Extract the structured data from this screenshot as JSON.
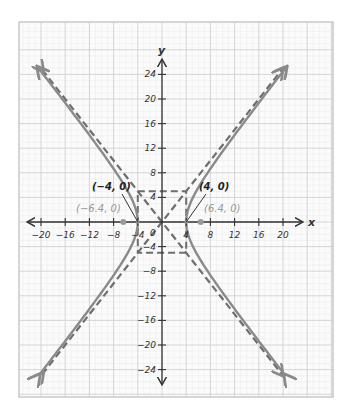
{
  "chart_data": {
    "type": "line",
    "title": "",
    "xlabel": "x",
    "ylabel": "y",
    "xlim": [
      -24,
      28
    ],
    "ylim": [
      -28,
      32
    ],
    "grid": true,
    "x_ticks": [
      -20,
      -16,
      -12,
      -8,
      -4,
      4,
      8,
      12,
      16,
      20
    ],
    "x_tick_labels": [
      "−20",
      "−16",
      "−12",
      "−8",
      "−4",
      "4",
      "8",
      "12",
      "16",
      "20"
    ],
    "y_ticks": [
      24,
      20,
      16,
      12,
      8,
      4,
      -4,
      -8,
      -12,
      -16,
      -20,
      -24
    ],
    "y_tick_labels": [
      "24",
      "20",
      "16",
      "12",
      "8",
      "4",
      "−4",
      "−8",
      "−12",
      "−16",
      "−20",
      "−24"
    ],
    "origin_label": "0",
    "series": [
      {
        "name": "hyperbola",
        "equation": "x^2/16 - y^2/25 = 1",
        "style": "solid",
        "a": 4,
        "b": 5
      },
      {
        "name": "asymptote positive",
        "equation": "y = 1.25x",
        "style": "dashed"
      },
      {
        "name": "asymptote negative",
        "equation": "y = -1.25x",
        "style": "dashed"
      },
      {
        "name": "central rectangle",
        "corners": [
          [
            -4,
            5
          ],
          [
            4,
            5
          ],
          [
            4,
            -5
          ],
          [
            -4,
            -5
          ]
        ],
        "style": "dashed"
      }
    ],
    "annotations": [
      {
        "label": "(−4, 0)",
        "x": -4,
        "y": 0,
        "kind": "vertex"
      },
      {
        "label": "(4, 0)",
        "x": 4,
        "y": 0,
        "kind": "vertex"
      },
      {
        "label": "(−6.4, 0)",
        "x": -6.4,
        "y": 0,
        "kind": "focus"
      },
      {
        "label": "(6.4, 0)",
        "x": 6.4,
        "y": 0,
        "kind": "focus"
      }
    ],
    "colors": {
      "curve": "#8a8a8a",
      "asymptote": "#6e6e6e",
      "axis": "#333333",
      "grid_major": "#cfcfcf",
      "grid_minor": "#e8e8e8",
      "focus_point": "#9a9a9a"
    }
  }
}
